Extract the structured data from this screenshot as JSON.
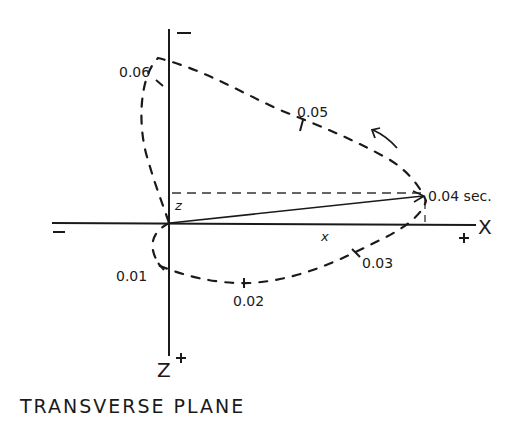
{
  "title": "TRANSVERSE PLANE",
  "axes": {
    "horizontal": {
      "name": "X",
      "positive_sign": "+",
      "negative_sign": "−",
      "component_label": "x"
    },
    "vertical": {
      "name": "Z",
      "positive_sign": "+",
      "negative_sign": "−",
      "component_label": "z"
    }
  },
  "loop": {
    "direction": "counterclockwise",
    "time_marks": [
      {
        "label": "0.01"
      },
      {
        "label": "0.02"
      },
      {
        "label": "0.03"
      },
      {
        "label": "0.04 sec."
      },
      {
        "label": "0.05"
      },
      {
        "label": "0.06"
      }
    ]
  },
  "vector": {
    "label_at_tip": "0.04 sec."
  },
  "colors": {
    "ink": "#1a1a1a",
    "background": "#ffffff"
  }
}
